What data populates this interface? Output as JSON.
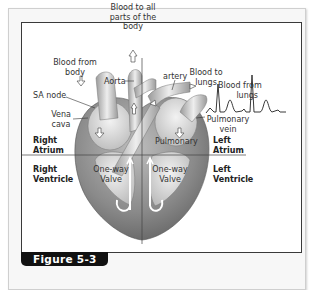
{
  "figure": {
    "caption": "Figure 5-3"
  },
  "labels": {
    "blood_to_all_parts_line1": "Blood to all",
    "blood_to_all_parts_line2": "parts of the",
    "blood_to_all_parts_line3": "body",
    "blood_from_body_line1": "Blood from",
    "blood_from_body_line2": "body",
    "aorta": "Aorta",
    "artery": "artery",
    "blood_to_lungs_line1": "Blood to",
    "blood_to_lungs_line2": "lungs",
    "blood_from_lungs_line1": "Blood from",
    "blood_from_lungs_line2": "lungs",
    "sa_node": "SA node",
    "vena_cava_line1": "Vena",
    "vena_cava_line2": "cava",
    "pulmonary": "Pulmonary",
    "pulmonary_vein_line1": "Pulmonary",
    "pulmonary_vein_line2": "vein",
    "one_way_valve_left_line1": "One-way",
    "one_way_valve_left_line2": "Valve",
    "one_way_valve_right_line1": "One-way",
    "one_way_valve_right_line2": "Valve"
  },
  "chambers": {
    "right_atrium_line1": "Right",
    "right_atrium_line2": "Atrium",
    "left_atrium_line1": "Left",
    "left_atrium_line2": "Atrium",
    "right_ventricle_line1": "Right",
    "right_ventricle_line2": "Ventricle",
    "left_ventricle_line1": "Left",
    "left_ventricle_line2": "Ventricle"
  },
  "colors": {
    "caption_bg": "#111111",
    "frame_border": "#3a3a3a",
    "heart_dark": "#6f6f6f",
    "heart_light": "#d9d9d9"
  }
}
